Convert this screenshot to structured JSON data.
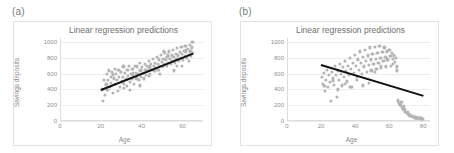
{
  "figure": {
    "panels": [
      {
        "tag": "(a)",
        "title": "Linear regression predictions",
        "xlabel": "Age",
        "ylabel": "Savings deposits"
      },
      {
        "tag": "(b)",
        "title": "Linear regression predictions",
        "xlabel": "Age",
        "ylabel": "Savings deposits"
      }
    ],
    "colors": {
      "point": "#b4b4b4",
      "line": "#121212",
      "grid": "#ededed",
      "axis": "#dcdcdc",
      "text": "#8a8a8a",
      "frame": "#e3e3e3"
    }
  },
  "chart_data": [
    {
      "type": "scatter",
      "panel": "(a)",
      "title": "Linear regression predictions",
      "xlabel": "Age",
      "ylabel": "Savings deposits",
      "xlim": [
        0,
        70
      ],
      "ylim": [
        0,
        1050
      ],
      "xticks": [
        0,
        20,
        40,
        60
      ],
      "yticks": [
        0,
        200,
        400,
        600,
        800,
        1000
      ],
      "grid": true,
      "legend": "none",
      "series": [
        {
          "name": "Savings deposits",
          "marker": "circle",
          "color": "#b4b4b4",
          "x": [
            20.4,
            21.0,
            21.6,
            22.1,
            22.4,
            22.9,
            23.2,
            23.6,
            24.0,
            24.4,
            24.8,
            25.1,
            25.5,
            25.9,
            26.3,
            26.7,
            27.0,
            27.4,
            27.8,
            28.2,
            28.6,
            29.0,
            29.4,
            29.8,
            30.2,
            30.6,
            31.0,
            31.4,
            31.8,
            32.2,
            32.6,
            33.0,
            33.4,
            33.8,
            34.2,
            34.6,
            35.0,
            35.4,
            35.8,
            36.2,
            36.6,
            37.0,
            37.4,
            37.8,
            38.2,
            38.6,
            39.0,
            39.4,
            39.8,
            40.2,
            40.6,
            41.0,
            41.4,
            41.8,
            42.2,
            42.6,
            43.0,
            43.4,
            43.8,
            44.2,
            44.6,
            45.0,
            45.4,
            45.8,
            46.2,
            46.6,
            47.0,
            47.4,
            47.8,
            48.2,
            48.6,
            49.0,
            49.4,
            49.8,
            50.2,
            50.6,
            51.0,
            51.4,
            51.8,
            52.2,
            52.6,
            53.0,
            53.4,
            53.8,
            54.2,
            54.6,
            55.0,
            55.4,
            55.8,
            56.2,
            56.6,
            57.0,
            57.4,
            57.8,
            58.2,
            58.6,
            59.0,
            59.4,
            59.8,
            60.2,
            60.6,
            61.0,
            61.4,
            61.8,
            62.2,
            62.6,
            63.0,
            63.4,
            63.8,
            64.2,
            64.6,
            65.0,
            22.7,
            26.0,
            31.2,
            35.6,
            39.2,
            44.0,
            48.8,
            52.8,
            57.2,
            61.6,
            63.2,
            64.8,
            30.0,
            34.4,
            43.6,
            50.8,
            55.6,
            59.6
          ],
          "y": [
            400,
            255,
            520,
            330,
            460,
            600,
            390,
            520,
            640,
            430,
            560,
            480,
            620,
            360,
            540,
            660,
            470,
            600,
            520,
            380,
            650,
            560,
            430,
            620,
            500,
            560,
            690,
            470,
            610,
            530,
            440,
            650,
            570,
            700,
            490,
            600,
            530,
            660,
            580,
            470,
            700,
            610,
            540,
            690,
            600,
            520,
            730,
            640,
            560,
            680,
            610,
            540,
            720,
            650,
            580,
            700,
            630,
            760,
            670,
            600,
            720,
            650,
            790,
            700,
            630,
            740,
            670,
            810,
            720,
            650,
            780,
            700,
            840,
            750,
            680,
            790,
            720,
            860,
            770,
            700,
            810,
            740,
            880,
            790,
            720,
            830,
            760,
            900,
            810,
            740,
            850,
            780,
            920,
            830,
            760,
            870,
            800,
            940,
            850,
            780,
            890,
            820,
            950,
            870,
            800,
            910,
            840,
            960,
            880,
            820,
            930,
            860,
            470,
            590,
            420,
            610,
            450,
            690,
            600,
            830,
            700,
            900,
            760,
            1000,
            620,
            390,
            570,
            880,
            640,
            700,
            730,
            820
          ],
          "n_points": 130
        }
      ],
      "fit_line": {
        "label": "linear regression fit",
        "color": "#121212",
        "x_start": 20,
        "y_start": 400,
        "x_end": 65,
        "y_end": 860,
        "slope": 10.2,
        "intercept": 196,
        "direction": "positive"
      }
    },
    {
      "type": "scatter",
      "panel": "(b)",
      "title": "Linear regression predictions",
      "xlabel": "Age",
      "ylabel": "Savings deposits",
      "xlim": [
        0,
        84
      ],
      "ylim": [
        0,
        1050
      ],
      "xticks": [
        0,
        20,
        40,
        60,
        80
      ],
      "yticks": [
        0,
        200,
        400,
        600,
        800,
        1000
      ],
      "grid": true,
      "legend": "none",
      "series": [
        {
          "name": "Savings deposits",
          "marker": "circle",
          "color": "#b4b4b4",
          "x": [
            20.5,
            21.2,
            21.8,
            22.4,
            23.0,
            23.5,
            24.1,
            24.7,
            25.3,
            25.9,
            26.4,
            27.0,
            27.6,
            28.2,
            28.8,
            29.3,
            29.9,
            30.5,
            31.1,
            31.7,
            32.2,
            32.8,
            33.4,
            34.0,
            34.6,
            35.1,
            35.7,
            36.3,
            36.9,
            37.5,
            38.0,
            38.6,
            39.2,
            39.8,
            40.4,
            40.9,
            41.5,
            42.1,
            42.7,
            43.3,
            43.8,
            44.4,
            45.0,
            45.6,
            46.2,
            46.7,
            47.3,
            47.9,
            48.5,
            49.1,
            49.6,
            50.2,
            50.8,
            51.4,
            52.0,
            52.5,
            53.1,
            53.7,
            54.3,
            54.9,
            55.4,
            56.0,
            56.6,
            57.2,
            57.8,
            58.3,
            58.9,
            59.5,
            60.1,
            60.7,
            61.2,
            61.8,
            62.4,
            63.0,
            63.6,
            64.1,
            64.7,
            22.0,
            26.8,
            30.0,
            33.8,
            37.2,
            41.0,
            44.8,
            48.0,
            51.6,
            55.0,
            58.6,
            62.0,
            64.4,
            65.3,
            66.0,
            66.8,
            67.5,
            68.2,
            68.9,
            69.6,
            70.3,
            71.0,
            71.7,
            72.4,
            73.1,
            73.8,
            74.5,
            75.2,
            75.9,
            76.6,
            77.3,
            78.0,
            78.7,
            79.4,
            66.4,
            69.0,
            72.0,
            74.8,
            77.0,
            79.0,
            71.4,
            76.2,
            68.5,
            73.5,
            78.4,
            67.2,
            70.8,
            75.5,
            79.6
          ],
          "y": [
            560,
            470,
            610,
            380,
            520,
            650,
            430,
            580,
            490,
            250,
            620,
            540,
            460,
            700,
            580,
            300,
            640,
            520,
            720,
            600,
            450,
            680,
            560,
            760,
            630,
            500,
            700,
            580,
            800,
            660,
            430,
            740,
            610,
            840,
            700,
            560,
            780,
            650,
            880,
            740,
            600,
            810,
            690,
            900,
            760,
            620,
            830,
            710,
            930,
            780,
            640,
            850,
            720,
            940,
            790,
            660,
            860,
            740,
            950,
            800,
            670,
            870,
            760,
            930,
            810,
            690,
            880,
            780,
            900,
            820,
            700,
            860,
            790,
            830,
            750,
            800,
            690,
            440,
            510,
            400,
            470,
            430,
            520,
            450,
            480,
            620,
            700,
            780,
            720,
            640,
            260,
            230,
            200,
            180,
            160,
            140,
            120,
            100,
            90,
            80,
            70,
            60,
            55,
            50,
            45,
            42,
            40,
            38,
            35,
            33,
            30,
            210,
            150,
            75,
            48,
            39,
            31,
            85,
            44,
            190,
            65,
            36,
            240,
            110,
            46,
            28
          ],
          "n_points": 135
        }
      ],
      "fit_line": {
        "label": "linear regression fit",
        "color": "#121212",
        "x_start": 20,
        "y_start": 720,
        "x_end": 80,
        "y_end": 330,
        "slope": -6.5,
        "intercept": 850,
        "direction": "negative"
      }
    }
  ]
}
